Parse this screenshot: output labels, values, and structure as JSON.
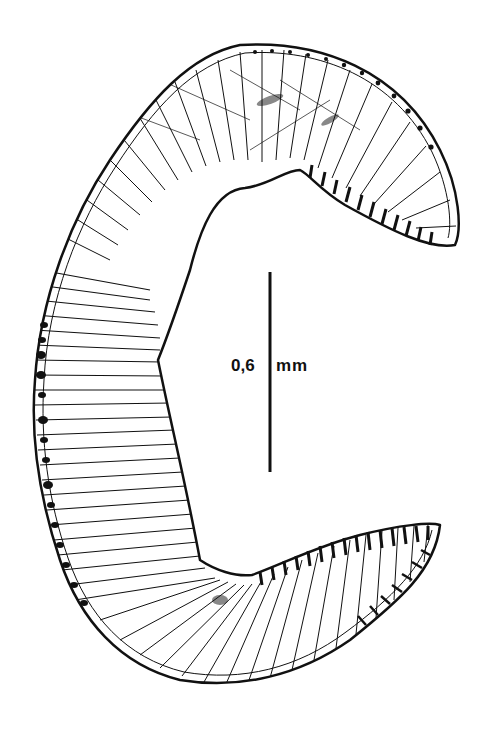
{
  "figure": {
    "ink_color": "#111111",
    "background_color": "#ffffff"
  },
  "scale_bar": {
    "value": "0,6",
    "unit": "mm",
    "x": 270,
    "y_top": 272,
    "y_bottom": 472
  }
}
